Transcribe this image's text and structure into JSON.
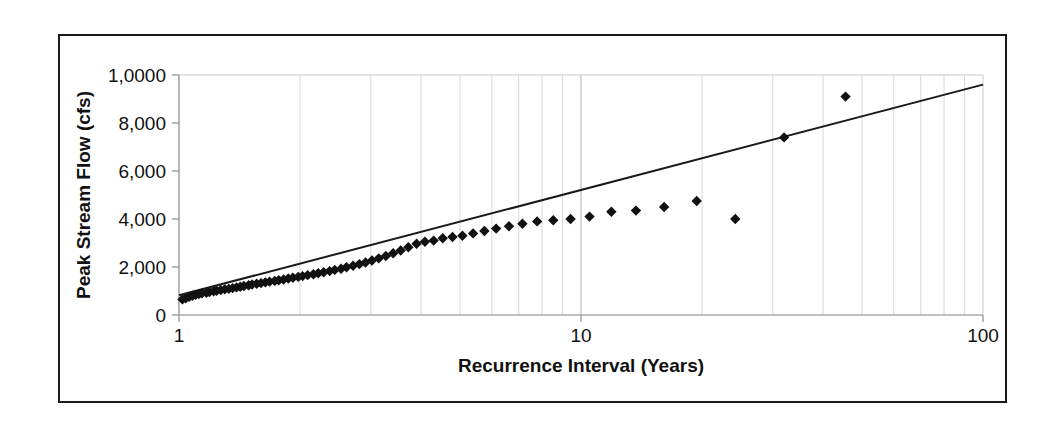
{
  "chart_data": {
    "type": "scatter",
    "title": "",
    "xlabel": "Recurrence Interval (Years)",
    "ylabel": "Peak Stream Flow (cfs)",
    "xscale": "log",
    "yscale": "linear",
    "xlim": [
      1,
      100
    ],
    "ylim": [
      0,
      10000
    ],
    "grid": true,
    "legend": false,
    "x_tick_labels": [
      "1",
      "10",
      "100"
    ],
    "x_tick_values": [
      1,
      10,
      100
    ],
    "y_tick_labels": [
      "1,0000",
      "8,000",
      "6,000",
      "4,000",
      "2,000",
      "0"
    ],
    "y_tick_values": [
      10000,
      8000,
      6000,
      4000,
      2000,
      0
    ],
    "marker": "diamond",
    "marker_color": "#111111",
    "series": [
      {
        "name": "Peak Stream Flow",
        "type": "scatter",
        "x": [
          1.02,
          1.04,
          1.06,
          1.08,
          1.1,
          1.12,
          1.14,
          1.17,
          1.19,
          1.22,
          1.24,
          1.27,
          1.3,
          1.33,
          1.36,
          1.39,
          1.42,
          1.45,
          1.49,
          1.52,
          1.56,
          1.6,
          1.64,
          1.68,
          1.73,
          1.77,
          1.82,
          1.87,
          1.92,
          1.98,
          2.03,
          2.09,
          2.16,
          2.22,
          2.29,
          2.37,
          2.44,
          2.53,
          2.61,
          2.71,
          2.81,
          2.91,
          3.02,
          3.14,
          3.27,
          3.41,
          3.56,
          3.72,
          3.9,
          4.09,
          4.3,
          4.53,
          4.79,
          5.07,
          5.39,
          5.75,
          6.15,
          6.62,
          7.15,
          7.78,
          8.53,
          9.42,
          10.5,
          11.9,
          13.7,
          16.1,
          19.4,
          24.2,
          32.0,
          45.5
        ],
        "y": [
          650,
          700,
          760,
          800,
          840,
          870,
          900,
          930,
          960,
          990,
          1010,
          1040,
          1070,
          1090,
          1120,
          1150,
          1180,
          1210,
          1240,
          1270,
          1300,
          1330,
          1360,
          1390,
          1420,
          1450,
          1480,
          1520,
          1550,
          1590,
          1620,
          1660,
          1700,
          1740,
          1780,
          1830,
          1880,
          1930,
          1990,
          2050,
          2120,
          2190,
          2270,
          2360,
          2460,
          2570,
          2690,
          2820,
          2970,
          3050,
          3100,
          3200,
          3250,
          3300,
          3400,
          3500,
          3600,
          3700,
          3800,
          3900,
          3950,
          4000,
          4100,
          4300,
          4350,
          4500,
          4750,
          4000,
          7400,
          9100
        ]
      },
      {
        "name": "Trend Line",
        "type": "line",
        "x": [
          1.0,
          100.0
        ],
        "y": [
          820,
          9600
        ]
      }
    ],
    "annotations": []
  },
  "axes": {
    "y_axis_title": "Peak Stream Flow (cfs)",
    "x_axis_title": "Recurrence Interval (Years)"
  }
}
